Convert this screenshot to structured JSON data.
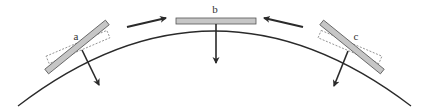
{
  "diagram": {
    "colors": {
      "line": "#2a2a2a",
      "plate_fill": "#c6c6c6",
      "plate_stroke": "#555555",
      "dashed_outline": "#888888",
      "background": "#ffffff"
    },
    "labels": {
      "a": "a",
      "b": "b",
      "c": "c"
    },
    "plates": [
      {
        "id": "a",
        "label": "a",
        "position": "left slope",
        "tilted": true,
        "has_dashed_outline": true
      },
      {
        "id": "b",
        "label": "b",
        "position": "apex",
        "tilted": false,
        "has_dashed_outline": false
      },
      {
        "id": "c",
        "label": "c",
        "position": "right slope",
        "tilted": true,
        "has_dashed_outline": true
      }
    ],
    "arrows": [
      {
        "id": "converge-left",
        "direction": "toward b (rightward)"
      },
      {
        "id": "converge-right",
        "direction": "toward b (leftward)"
      },
      {
        "id": "force-a",
        "direction": "down-right from plate a"
      },
      {
        "id": "force-b",
        "direction": "straight down from plate b"
      },
      {
        "id": "force-c",
        "direction": "down-left from plate c"
      }
    ]
  }
}
